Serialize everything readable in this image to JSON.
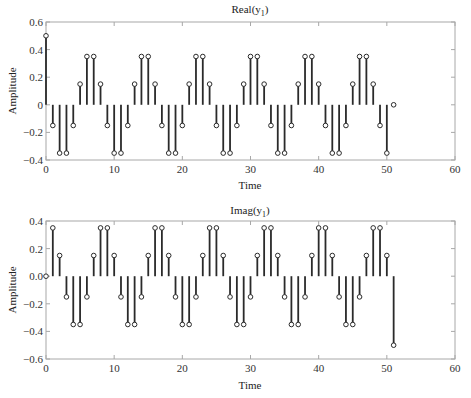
{
  "chart_data": [
    {
      "type": "stem",
      "title": "Real(y1)",
      "title_main": "Real(y",
      "title_sub": "1",
      "title_close": ")",
      "xlabel": "Time",
      "ylabel": "Amplitude",
      "xlim": [
        0,
        60
      ],
      "ylim": [
        -0.4,
        0.6
      ],
      "xticks": [
        0,
        10,
        20,
        30,
        40,
        50,
        60
      ],
      "yticks": [
        -0.4,
        -0.2,
        0,
        0.2,
        0.4,
        0.6
      ],
      "ytick_labels": [
        "−0.4",
        "−0.2",
        "0",
        "0.2",
        "0.4",
        "0.6"
      ],
      "grid": false,
      "x": [
        0,
        1,
        2,
        3,
        4,
        5,
        6,
        7,
        8,
        9,
        10,
        11,
        12,
        13,
        14,
        15,
        16,
        17,
        18,
        19,
        20,
        21,
        22,
        23,
        24,
        25,
        26,
        27,
        28,
        29,
        30,
        31,
        32,
        33,
        34,
        35,
        36,
        37,
        38,
        39,
        40,
        41,
        42,
        43,
        44,
        45,
        46,
        47,
        48,
        49,
        50,
        51
      ],
      "values": [
        0.5,
        -0.15,
        -0.35,
        -0.35,
        -0.15,
        0.15,
        0.35,
        0.35,
        0.15,
        -0.15,
        -0.35,
        -0.35,
        -0.15,
        0.15,
        0.35,
        0.35,
        0.15,
        -0.15,
        -0.35,
        -0.35,
        -0.15,
        0.15,
        0.35,
        0.35,
        0.15,
        -0.15,
        -0.35,
        -0.35,
        -0.15,
        0.15,
        0.35,
        0.35,
        0.15,
        -0.15,
        -0.35,
        -0.35,
        -0.15,
        0.15,
        0.35,
        0.35,
        0.15,
        -0.15,
        -0.35,
        -0.35,
        -0.15,
        0.15,
        0.35,
        0.35,
        0.15,
        -0.15,
        -0.35,
        0
      ]
    },
    {
      "type": "stem",
      "title": "Imag(y1)",
      "title_main": "Imag(y",
      "title_sub": "1",
      "title_close": ")",
      "xlabel": "Time",
      "ylabel": "Amplitude",
      "xlim": [
        0,
        60
      ],
      "ylim": [
        -0.6,
        0.4
      ],
      "xticks": [
        0,
        10,
        20,
        30,
        40,
        50,
        60
      ],
      "yticks": [
        -0.6,
        -0.4,
        -0.2,
        0,
        0.2,
        0.4
      ],
      "ytick_labels": [
        "−0.6",
        "−0.4",
        "−0.2",
        "0.0",
        "0.2",
        "0.4"
      ],
      "grid": false,
      "x": [
        0,
        1,
        2,
        3,
        4,
        5,
        6,
        7,
        8,
        9,
        10,
        11,
        12,
        13,
        14,
        15,
        16,
        17,
        18,
        19,
        20,
        21,
        22,
        23,
        24,
        25,
        26,
        27,
        28,
        29,
        30,
        31,
        32,
        33,
        34,
        35,
        36,
        37,
        38,
        39,
        40,
        41,
        42,
        43,
        44,
        45,
        46,
        47,
        48,
        49,
        50,
        51
      ],
      "values": [
        0,
        0.35,
        0.15,
        -0.15,
        -0.35,
        -0.35,
        -0.15,
        0.15,
        0.35,
        0.35,
        0.15,
        -0.15,
        -0.35,
        -0.35,
        -0.15,
        0.15,
        0.35,
        0.35,
        0.15,
        -0.15,
        -0.35,
        -0.35,
        -0.15,
        0.15,
        0.35,
        0.35,
        0.15,
        -0.15,
        -0.35,
        -0.35,
        -0.15,
        0.15,
        0.35,
        0.35,
        0.15,
        -0.15,
        -0.35,
        -0.35,
        -0.15,
        0.15,
        0.35,
        0.35,
        0.15,
        -0.15,
        -0.35,
        -0.35,
        -0.15,
        0.15,
        0.35,
        0.35,
        0.15,
        -0.5
      ]
    }
  ]
}
